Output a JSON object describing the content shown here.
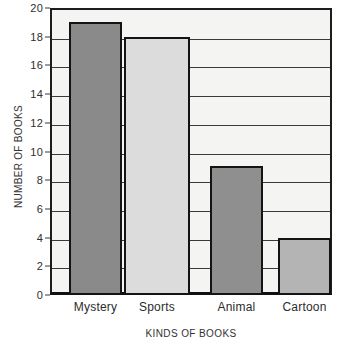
{
  "chart_data": {
    "type": "bar",
    "title": "",
    "xlabel": "KINDS OF BOOKS",
    "ylabel": "NUMBER OF BOOKS",
    "categories": [
      "Mystery",
      "Sports",
      "Animal",
      "Cartoon"
    ],
    "values": [
      19,
      18,
      9,
      4
    ],
    "ylim": [
      0,
      20
    ],
    "ytick_step": 2,
    "yticks": [
      0,
      2,
      4,
      6,
      8,
      10,
      12,
      14,
      16,
      18,
      20
    ],
    "ytick_labels": [
      "0",
      "2",
      "4",
      "6",
      "8",
      "10",
      "12",
      "14",
      "16",
      "18",
      "20"
    ],
    "grid": true,
    "grid_axis": "y",
    "legend": false,
    "legend_position": "none",
    "bar_colors": [
      "#8a8a8a",
      "#dcdcdc",
      "#8f8f8f",
      "#b4b4b4"
    ],
    "bar_edge_color": "#141414",
    "plot_background": "#f4f4f2",
    "grid_color": "#3a3a3a",
    "axis_color": "#111111",
    "series": [
      {
        "name": "Number of books",
        "values": [
          19,
          18,
          9,
          4
        ]
      }
    ],
    "points": [
      {
        "category": "Mystery",
        "value": 19,
        "color": "#8a8a8a"
      },
      {
        "category": "Sports",
        "value": 18,
        "color": "#dcdcdc"
      },
      {
        "category": "Animal",
        "value": 9,
        "color": "#8f8f8f"
      },
      {
        "category": "Cartoon",
        "value": 4,
        "color": "#b4b4b4"
      }
    ]
  }
}
